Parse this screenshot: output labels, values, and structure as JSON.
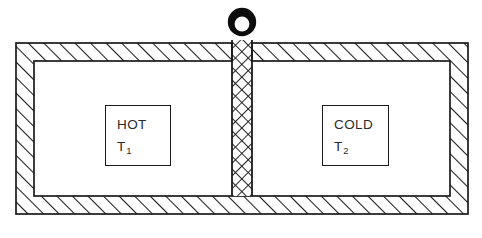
{
  "diagram": {
    "background_color": "#ffffff",
    "line_color": "#1a1a1a",
    "hatch_color": "#1a1a1a",
    "knob": {
      "name": "ring-handle",
      "description": "black ring handle on top of the partition",
      "outer_diameter": 30,
      "inner_diameter": 14,
      "center_x": 242,
      "center_y": 22
    },
    "outer_wall": {
      "name": "insulating-outer-wall",
      "hatch_style": "single-diagonal",
      "thickness": 18,
      "outer_left": 16,
      "outer_top": 43,
      "outer_right": 468,
      "outer_bottom": 214
    },
    "partition": {
      "name": "central-partition",
      "hatch_style": "cross-hatch",
      "left": 232,
      "right": 252,
      "top": 40,
      "bottom": 196
    },
    "chambers": [
      {
        "id": "hot",
        "state_label": "HOT",
        "temperature_symbol": "T",
        "temperature_subscript": "1",
        "box": {
          "left": 105,
          "top": 105,
          "width": 66,
          "height": 61
        }
      },
      {
        "id": "cold",
        "state_label": "COLD",
        "temperature_symbol": "T",
        "temperature_subscript": "2",
        "box": {
          "left": 322,
          "top": 105,
          "width": 67,
          "height": 61
        }
      }
    ]
  }
}
